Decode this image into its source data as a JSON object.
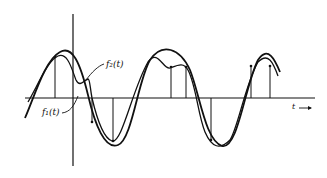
{
  "diagram": {
    "labels": {
      "f2": "f₂(t)",
      "f1": "f₁(t)",
      "t_axis": "t →"
    },
    "colors": {
      "ink": "#111111",
      "background": "#ffffff"
    },
    "axes": {
      "horizontal_y": 98,
      "horizontal_x_range": [
        25,
        315
      ],
      "vertical_x": 73,
      "vertical_y_range": [
        14,
        165
      ]
    },
    "sample_lines_x": [
      55,
      92,
      113,
      171,
      186,
      211,
      251,
      270
    ]
  }
}
